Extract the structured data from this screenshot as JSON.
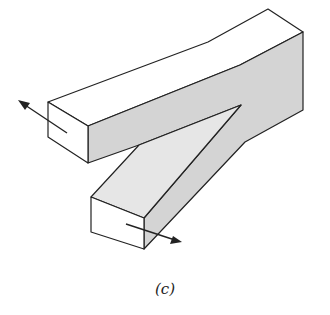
{
  "figure": {
    "caption": "(c)",
    "colors": {
      "stroke": "#222222",
      "shaded_face": "#d4d4d4",
      "light_face": "#e6e6e6",
      "white_face": "#ffffff",
      "background": "#ffffff"
    },
    "arrows": [
      {
        "name": "upper-arm-force",
        "direction": "up-left"
      },
      {
        "name": "lower-arm-force",
        "direction": "down-right"
      }
    ]
  }
}
